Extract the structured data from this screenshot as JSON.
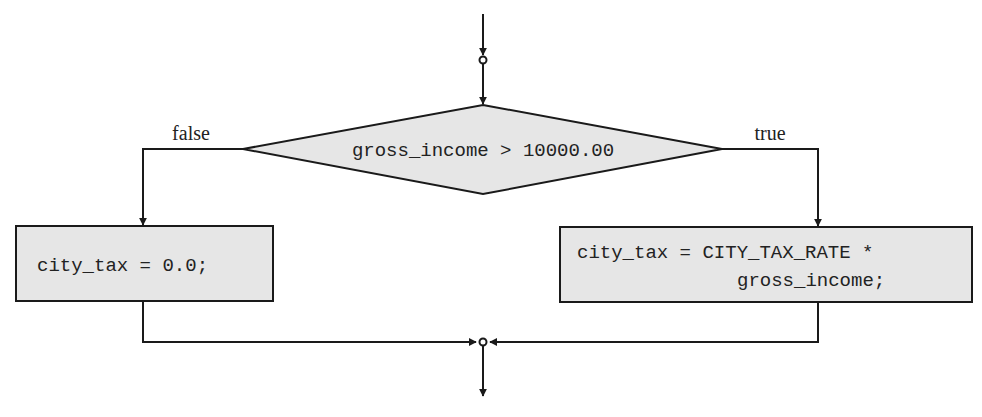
{
  "diagram": {
    "type": "flowchart",
    "colors": {
      "stroke": "#1a1a1a",
      "fill": "#e6e6e6",
      "text": "#222222"
    },
    "decision": {
      "condition": "gross_income > 10000.00"
    },
    "branches": {
      "false_label": "false",
      "true_label": "true"
    },
    "false_action": {
      "line1": "city_tax = 0.0;"
    },
    "true_action": {
      "line1": "city_tax = CITY_TAX_RATE *",
      "line2": "gross_income;"
    }
  }
}
